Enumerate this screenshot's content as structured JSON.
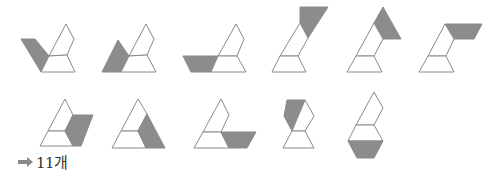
{
  "colors": {
    "stroke": "#8a8a8a",
    "shaded": "#8c8c8c",
    "background": "#ffffff",
    "text": "#333333"
  },
  "answer": {
    "arrow_icon": "right-arrow-icon",
    "text": "11개"
  },
  "figures": [
    {
      "id": 1,
      "row": 1,
      "shaded": "left parallelogram"
    },
    {
      "id": 2,
      "row": 1,
      "shaded": "left trapezoid-triangle"
    },
    {
      "id": 3,
      "row": 1,
      "shaded": "left bottom trapezoid"
    },
    {
      "id": 4,
      "row": 1,
      "shaded": "top parallelogram"
    },
    {
      "id": 5,
      "row": 1,
      "shaded": "top triangle-right"
    },
    {
      "id": 6,
      "row": 1,
      "shaded": "top right trapezoid"
    },
    {
      "id": 7,
      "row": 2,
      "shaded": "right parallelogram"
    },
    {
      "id": 8,
      "row": 2,
      "shaded": "right lower piece"
    },
    {
      "id": 9,
      "row": 2,
      "shaded": "right bottom trapezoid"
    },
    {
      "id": 10,
      "row": 2,
      "shaded": "hexagon left half"
    },
    {
      "id": 11,
      "row": 2,
      "shaded": "bottom trapezoid"
    }
  ]
}
